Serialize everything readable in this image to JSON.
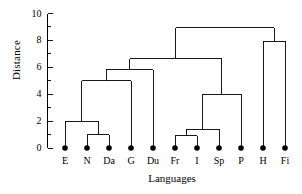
{
  "chart_data": {
    "type": "dendrogram",
    "title": "",
    "xlabel": "Languages",
    "ylabel": "Distance",
    "ylim": [
      0,
      10
    ],
    "yticks": [
      0,
      2,
      4,
      6,
      8,
      10
    ],
    "yticklabels": [
      "0",
      "2",
      "4",
      "6",
      "8",
      "10"
    ],
    "yminorticks": [
      1,
      3,
      5,
      7,
      9
    ],
    "grid": false,
    "legend": null,
    "leaves": [
      "E",
      "N",
      "Da",
      "G",
      "Du",
      "Fr",
      "I",
      "Sp",
      "P",
      "H",
      "Fi"
    ],
    "leaf_marker": "filled-circle",
    "leaf_height": 0,
    "merges": [
      {
        "id": "m1",
        "children": [
          "N",
          "Da"
        ],
        "height": 1.0
      },
      {
        "id": "m2",
        "children": [
          "E",
          "m1"
        ],
        "height": 2.0
      },
      {
        "id": "m3",
        "children": [
          "m2",
          "G"
        ],
        "height": 5.0
      },
      {
        "id": "m4",
        "children": [
          "m3",
          "Du"
        ],
        "height": 5.8
      },
      {
        "id": "m5",
        "children": [
          "Fr",
          "I"
        ],
        "height": 0.9
      },
      {
        "id": "m6",
        "children": [
          "m5",
          "Sp"
        ],
        "height": 1.4
      },
      {
        "id": "m7",
        "children": [
          "m6",
          "P"
        ],
        "height": 4.0
      },
      {
        "id": "m8",
        "children": [
          "m4",
          "m7"
        ],
        "height": 6.65
      },
      {
        "id": "m9",
        "children": [
          "H",
          "Fi"
        ],
        "height": 7.95
      },
      {
        "id": "m10",
        "children": [
          "m8",
          "m9"
        ],
        "height": 8.95
      }
    ],
    "line_color": "#000000",
    "background": "#ffffff"
  }
}
